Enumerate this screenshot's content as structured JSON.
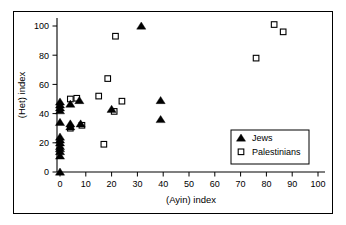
{
  "chart_data": {
    "type": "scatter",
    "title": "",
    "xlabel": "(Ayin) index",
    "ylabel": "(Het) index",
    "xlim": [
      -3,
      105
    ],
    "ylim": [
      -5,
      108
    ],
    "xticks": [
      0,
      10,
      20,
      30,
      40,
      50,
      60,
      70,
      80,
      90,
      100
    ],
    "yticks": [
      0,
      20,
      40,
      60,
      80,
      100
    ],
    "xtick_labels": [
      "0",
      "10",
      "20",
      "30",
      "40",
      "50",
      "60",
      "70",
      "80",
      "90",
      "100"
    ],
    "ytick_labels": [
      "0",
      "20",
      "40",
      "60",
      "80",
      "100"
    ],
    "grid": false,
    "legend_position": "lower right",
    "series": [
      {
        "name": "Jews",
        "marker": "filled-triangle",
        "color": "#000000",
        "points": [
          [
            0,
            0
          ],
          [
            0,
            11
          ],
          [
            0,
            14
          ],
          [
            0,
            16
          ],
          [
            0,
            17.5
          ],
          [
            0,
            20
          ],
          [
            0,
            22
          ],
          [
            0,
            24
          ],
          [
            0,
            34
          ],
          [
            0,
            42
          ],
          [
            0,
            44
          ],
          [
            0,
            46
          ],
          [
            0,
            48
          ],
          [
            4,
            31
          ],
          [
            4,
            33
          ],
          [
            4,
            46.5
          ],
          [
            7.5,
            49
          ],
          [
            8,
            33
          ],
          [
            20,
            43
          ],
          [
            31.5,
            100
          ],
          [
            39,
            36
          ],
          [
            39,
            49
          ]
        ]
      },
      {
        "name": "Palestinians",
        "marker": "open-square",
        "color": "#000000",
        "points": [
          [
            4,
            50
          ],
          [
            4,
            30
          ],
          [
            6.5,
            50.5
          ],
          [
            8.5,
            32
          ],
          [
            15,
            52
          ],
          [
            17,
            19
          ],
          [
            18.5,
            64
          ],
          [
            21,
            41.5
          ],
          [
            21.5,
            93
          ],
          [
            24,
            48.5
          ],
          [
            76,
            78
          ],
          [
            83,
            101
          ],
          [
            86.5,
            96
          ]
        ]
      }
    ]
  },
  "legend": {
    "entries": [
      {
        "label": "Jews",
        "marker": "filled-triangle"
      },
      {
        "label": "Palestinians",
        "marker": "open-square"
      }
    ]
  }
}
